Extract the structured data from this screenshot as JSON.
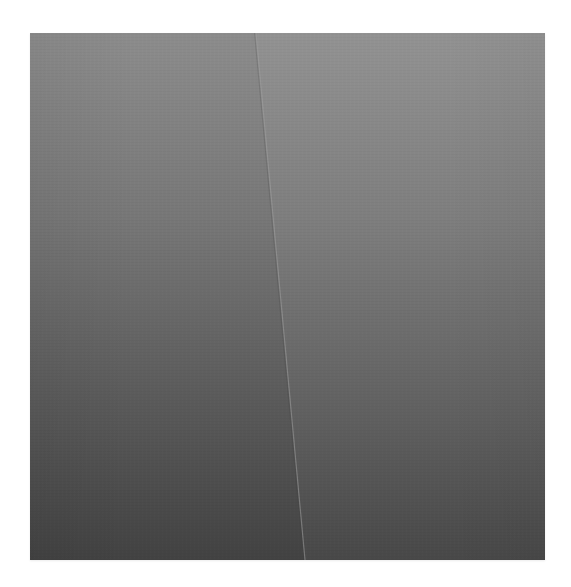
{
  "image": {
    "description": "Grayscale photograph of a smooth surface with a slightly diagonal vertical crease/fold dividing two panels",
    "frame": {
      "x": 30,
      "y": 33,
      "width": 515,
      "height": 527
    },
    "colors": {
      "background": "#ffffff",
      "top_tone": "#8f8f8f",
      "bottom_tone": "#454545",
      "crease_highlight": "#a0a0a0"
    },
    "crease": {
      "top": {
        "x": 256,
        "y": 33
      },
      "bottom": {
        "x": 305,
        "y": 560
      }
    }
  }
}
